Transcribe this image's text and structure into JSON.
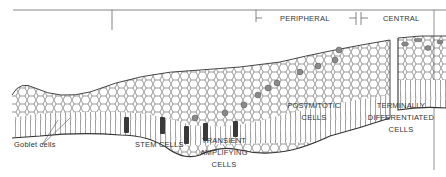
{
  "diagram": {
    "type": "corneal-limbal epithelium schematic",
    "regions": {
      "peripheral": "PERIPHERAL",
      "central": "CENTRAL"
    },
    "labels": {
      "goblet_cells": "Goblet cells",
      "stem_cells": "STEM CELLS",
      "transient_amplifying": [
        "TRANSIENT",
        "AMPLIFYING",
        "CELLS"
      ],
      "postmitotic": [
        "POSTMITOTIC",
        "CELLS"
      ],
      "terminally_differentiated": [
        "TERMINALLY",
        "DIFFERENTIATED",
        "CELLS"
      ]
    },
    "colors": {
      "line": "#555555",
      "cell_outline": "#444444",
      "stem_cell_fill": "#3a3a3a",
      "ta_cell_fill": "#8a8a8a",
      "background": "#ffffff"
    }
  }
}
